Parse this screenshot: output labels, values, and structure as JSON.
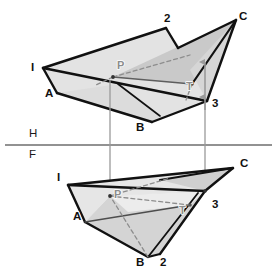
{
  "figure": {
    "background_color": "#ffffff",
    "outline_color": "#111111",
    "faint_label_color": "#8d8d8d",
    "ground_line_color": "#6e6e6e",
    "projector_color": "#9a9a9a",
    "fills": {
      "plane_light": "#e3e3e3",
      "plane_mid": "#d2d2d2",
      "plane_dark": "#bdbdbd",
      "plane_pale": "#eeeeee"
    }
  },
  "ground_line": {
    "label_h": "H",
    "label_f": "F",
    "y": 145,
    "x_start": 5,
    "x_end": 272,
    "label_h_x": 29,
    "label_h_y": 137,
    "label_f_x": 29,
    "label_f_y": 158
  },
  "top_view": {
    "name": "pictorial-view",
    "labels": [
      {
        "key": "I",
        "text": "I",
        "x": 31,
        "y": 71,
        "tone": "dark"
      },
      {
        "key": "A",
        "text": "A",
        "x": 45,
        "y": 97,
        "tone": "dark"
      },
      {
        "key": "B",
        "text": "B",
        "x": 136,
        "y": 131,
        "tone": "dark"
      },
      {
        "key": "two",
        "text": "2",
        "x": 164,
        "y": 22,
        "tone": "dark"
      },
      {
        "key": "C",
        "text": "C",
        "x": 239,
        "y": 20,
        "tone": "dark"
      },
      {
        "key": "three",
        "text": "3",
        "x": 212,
        "y": 107,
        "tone": "dark"
      },
      {
        "key": "P",
        "text": "P",
        "x": 117,
        "y": 69,
        "tone": "faint"
      },
      {
        "key": "T",
        "text": "T",
        "x": 186,
        "y": 90,
        "tone": "faint"
      }
    ],
    "vertices": {
      "I": [
        43,
        68
      ],
      "two_corner": [
        166,
        28
      ],
      "C": [
        236,
        20
      ],
      "three": [
        207,
        101
      ],
      "A": [
        57,
        93
      ],
      "B": [
        152,
        122
      ],
      "P": [
        113,
        77
      ],
      "T": [
        192,
        84
      ]
    }
  },
  "bottom_view": {
    "name": "front-view",
    "labels": [
      {
        "key": "I",
        "text": "I",
        "x": 57,
        "y": 181,
        "tone": "dark"
      },
      {
        "key": "A",
        "text": "A",
        "x": 73,
        "y": 220,
        "tone": "dark"
      },
      {
        "key": "B",
        "text": "B",
        "x": 136,
        "y": 266,
        "tone": "dark"
      },
      {
        "key": "two",
        "text": "2",
        "x": 160,
        "y": 266,
        "tone": "dark"
      },
      {
        "key": "C",
        "text": "C",
        "x": 240,
        "y": 167,
        "tone": "dark"
      },
      {
        "key": "three",
        "text": "3",
        "x": 212,
        "y": 208,
        "tone": "dark"
      },
      {
        "key": "P",
        "text": "P",
        "x": 114,
        "y": 198,
        "tone": "faint"
      },
      {
        "key": "T",
        "text": "T",
        "x": 179,
        "y": 214,
        "tone": "faint"
      }
    ],
    "vertices": {
      "I": [
        68,
        185
      ],
      "A": [
        85,
        222
      ],
      "B": [
        148,
        257
      ],
      "two": [
        160,
        254
      ],
      "C": [
        233,
        168
      ],
      "three": [
        205,
        191
      ],
      "P": [
        110,
        196
      ],
      "T": [
        190,
        205
      ]
    }
  },
  "projectors": [
    {
      "name": "left-projector",
      "x": 110,
      "y_top": 80,
      "y_bottom": 196,
      "arrow": "down"
    },
    {
      "name": "right-projector",
      "x": 205,
      "y_top": 99,
      "y_bottom": 192,
      "arrow": "both"
    }
  ],
  "arrows_top": [
    {
      "name": "arrow-to-C-edge",
      "x": 205,
      "y_from": 99,
      "y_to": 60
    },
    {
      "name": "arrow-to-3",
      "x": 205,
      "y_from": 103,
      "y_to": 84
    }
  ]
}
